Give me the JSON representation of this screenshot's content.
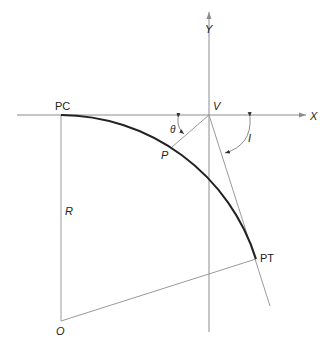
{
  "diagram": {
    "labels": {
      "y_axis": "Y",
      "x_axis": "X",
      "pc": "PC",
      "v": "V",
      "theta": "θ",
      "p": "P",
      "i": "I",
      "r": "R",
      "pt": "PT",
      "o": "O"
    },
    "colors": {
      "curve": "#222222",
      "lines": "#9a9a9a",
      "text": "#222222"
    }
  }
}
